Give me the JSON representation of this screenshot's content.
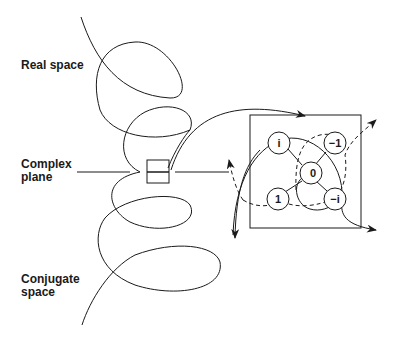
{
  "diagram": {
    "labels": {
      "real_space": "Real space",
      "complex_plane_line1": "Complex",
      "complex_plane_line2": "plane",
      "conjugate_space_line1": "Conjugate",
      "conjugate_space_line2": "space"
    },
    "nodes": [
      {
        "id": "i",
        "label": "i"
      },
      {
        "id": "neg1",
        "label": "−1"
      },
      {
        "id": "zero",
        "label": "0"
      },
      {
        "id": "one",
        "label": "1"
      },
      {
        "id": "negi",
        "label": "−i"
      }
    ],
    "colors": {
      "stroke": "#1a1a1a",
      "background": "#ffffff"
    }
  }
}
